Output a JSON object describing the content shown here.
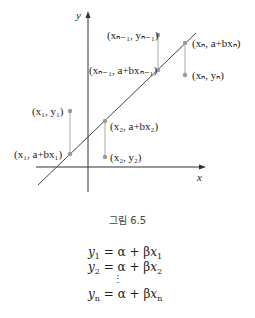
{
  "figure": {
    "axes": {
      "x_label": "x",
      "y_label": "y"
    },
    "labels": {
      "p1_obs": "(x₁, y₁)",
      "p1_fit": "(x₁, a+bx₁)",
      "p2_fit": "(x₂, a+bx₂)",
      "p2_obs": "(x₂, y₂)",
      "pn1_obs": "(xₙ₋₁, yₙ₋₁)",
      "pn1_fit": "(xₙ₋₁, a+bxₙ₋₁)",
      "pn_fit": "(xₙ, a+bxₙ)",
      "pn_obs": "(xₙ, yₙ)"
    },
    "colors": {
      "axis": "#333333",
      "line": "#444444",
      "point": "#999999",
      "residual": "#aaaaaa"
    },
    "caption": "그림 6.5"
  },
  "equations": [
    {
      "lhs": "y",
      "lhs_sub": "1",
      "rhs_a": "α + β",
      "rhs_x": "x",
      "rhs_sub": "1"
    },
    {
      "lhs": "y",
      "lhs_sub": "2",
      "rhs_a": "α + β",
      "rhs_x": "x",
      "rhs_sub": "2"
    },
    {
      "vdots": "⋮"
    },
    {
      "lhs": "y",
      "lhs_sub": "n",
      "rhs_a": "α + β",
      "rhs_x": "x",
      "rhs_sub": "n"
    }
  ]
}
